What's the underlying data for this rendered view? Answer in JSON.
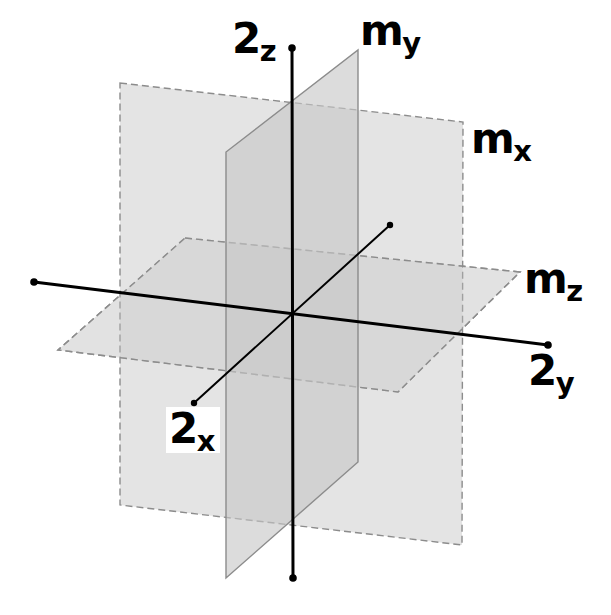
{
  "figure": {
    "kind": "3d-symmetry-element-diagram",
    "background_color": "#ffffff",
    "stroke_color": "#000000",
    "width": 611,
    "height": 615
  },
  "planes": [
    {
      "id": "mx",
      "label_lead": "m",
      "label_sub": "x",
      "description": "back vertical mirror plane",
      "fill_color": "#d4d4d4",
      "opacity": 0.62,
      "edge_color": "#8c8c8c",
      "points": "120,83 463,122 462,545 120,505"
    },
    {
      "id": "my",
      "label_lead": "m",
      "label_sub": "y",
      "description": "middle vertical mirror plane",
      "fill_color": "#c6c6c6",
      "opacity": 0.62,
      "edge_color": "#8c8c8c",
      "points": "358,50 358,462 226,578 226,152"
    },
    {
      "id": "mz",
      "label_lead": "m",
      "label_sub": "z",
      "description": "horizontal mirror plane",
      "fill_color": "#dadada",
      "opacity": 0.58,
      "edge_color": "#8c8c8c",
      "points": "185,238 520,272 398,392 58,350"
    }
  ],
  "axes": [
    {
      "id": "2z",
      "label_lead": "2",
      "label_sub": "z",
      "description": "vertical two-fold rotation axis",
      "x1": 292,
      "y1": 48,
      "x2": 293,
      "y2": 578,
      "cap_start": true,
      "cap_end": true,
      "stroke_width": 3.0
    },
    {
      "id": "2y",
      "label_lead": "2",
      "label_sub": "y",
      "description": "horizontal left-right two-fold rotation axis",
      "x1": 34,
      "y1": 282,
      "x2": 548,
      "y2": 345,
      "cap_start": true,
      "cap_end": true,
      "stroke_width": 3.0
    },
    {
      "id": "2x",
      "label_lead": "2",
      "label_sub": "x",
      "description": "oblique front-back two-fold rotation axis",
      "x1": 194,
      "y1": 403,
      "x2": 390,
      "y2": 225,
      "cap_start": true,
      "cap_end": true,
      "stroke_width": 2.0
    }
  ],
  "labels": {
    "two_z": {
      "lead": "2",
      "sub": "z",
      "x": 232,
      "y": 18,
      "boxed": false
    },
    "m_y": {
      "lead": "m",
      "sub": "y",
      "x": 360,
      "y": 10,
      "boxed": false
    },
    "m_x": {
      "lead": "m",
      "sub": "x",
      "x": 471,
      "y": 118,
      "boxed": false
    },
    "m_z": {
      "lead": "m",
      "sub": "z",
      "x": 524,
      "y": 258,
      "boxed": false
    },
    "two_y": {
      "lead": "2",
      "sub": "y",
      "x": 528,
      "y": 350,
      "boxed": false
    },
    "two_x": {
      "lead": "2",
      "sub": "x",
      "x": 166,
      "y": 407,
      "boxed": true
    }
  }
}
